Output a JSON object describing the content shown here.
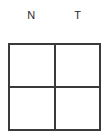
{
  "figure": {
    "type": "2x2-grid-table",
    "background_color": "#ffffff",
    "line_color": "#3a3a3a",
    "text_color": "#2b2b2b",
    "column_headers": [
      {
        "label": "N"
      },
      {
        "label": "T"
      }
    ],
    "rows": [
      {
        "cells": [
          {
            "value": ""
          },
          {
            "value": ""
          }
        ]
      },
      {
        "cells": [
          {
            "value": ""
          },
          {
            "value": ""
          }
        ]
      }
    ]
  }
}
